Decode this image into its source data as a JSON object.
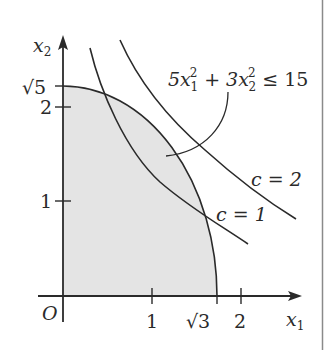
{
  "figure": {
    "type": "constraint-region-diagram",
    "colors": {
      "ink": "#2a2a2a",
      "region_fill": "#e4e4e4",
      "background": "#ffffff",
      "frame": "#8a8a8a"
    },
    "axes": {
      "x_label": "x",
      "x_label_sub": "1",
      "y_label": "x",
      "y_label_sub": "2",
      "origin_label": "O",
      "x_ticks": [
        {
          "value": 1,
          "label": "1"
        },
        {
          "value": 1.732,
          "label": "√3"
        },
        {
          "value": 2,
          "label": "2"
        }
      ],
      "y_ticks": [
        {
          "value": 1,
          "label": "1"
        },
        {
          "value": 2,
          "label": "2"
        },
        {
          "value": 2.236,
          "label": "√5"
        }
      ]
    },
    "region": {
      "constraint_label": {
        "coef1": "5x",
        "sub1": "1",
        "sup1": "2",
        "plus": " + 3x",
        "sub2": "2",
        "sup2": "2",
        "rhs": " ≤ 15"
      },
      "x_intercept": "√3",
      "y_intercept": "√5"
    },
    "level_curves": [
      {
        "label": "c = 1",
        "c": 1
      },
      {
        "label": "c = 2",
        "c": 2
      }
    ]
  }
}
